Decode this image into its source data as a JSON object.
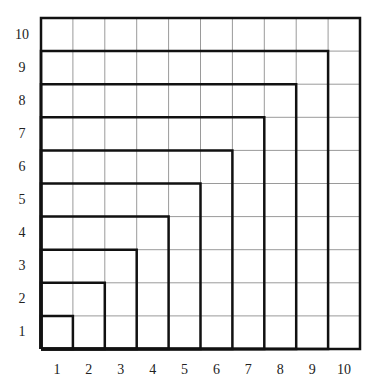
{
  "diagram": {
    "type": "nested-squares-grid",
    "grid_size": 10,
    "x_labels": [
      "1",
      "2",
      "3",
      "4",
      "5",
      "6",
      "7",
      "8",
      "9",
      "10"
    ],
    "y_labels": [
      "1",
      "2",
      "3",
      "4",
      "5",
      "6",
      "7",
      "8",
      "9",
      "10"
    ],
    "nested_square_sides": [
      1,
      2,
      3,
      4,
      5,
      6,
      7,
      8,
      9,
      10
    ],
    "colors": {
      "thin_grid": "#9a9a9a",
      "thick_line": "#111111",
      "background": "#ffffff"
    }
  }
}
